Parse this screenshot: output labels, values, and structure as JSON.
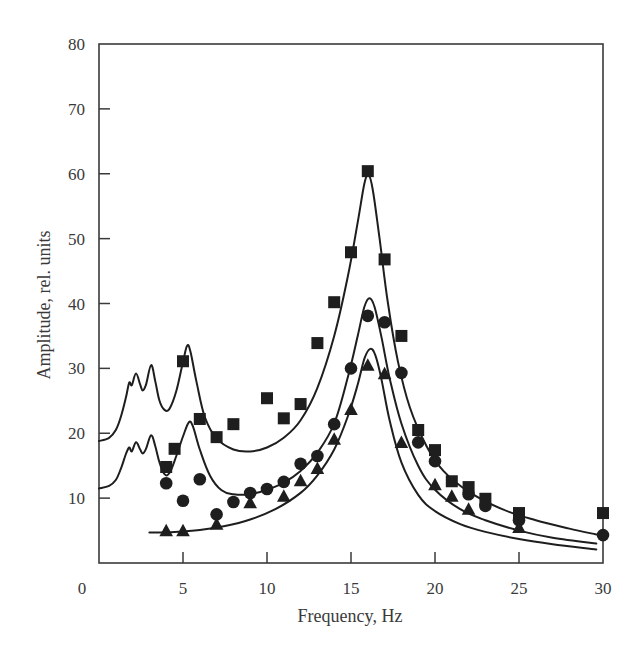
{
  "chart_data": {
    "type": "scatter",
    "title": "",
    "xlabel": "Frequency, Hz",
    "ylabel": "Amplitude, rel. units",
    "xlim": [
      0,
      30
    ],
    "ylim": [
      0,
      80
    ],
    "xticks": [
      0,
      5,
      10,
      15,
      20,
      25,
      30
    ],
    "yticks": [
      10,
      20,
      30,
      40,
      50,
      60,
      70,
      80
    ],
    "grid": false,
    "legend": null,
    "series": [
      {
        "name": "squares",
        "marker": "square",
        "points": [
          [
            4,
            14.8
          ],
          [
            4.5,
            17.6
          ],
          [
            5,
            31.1
          ],
          [
            6,
            22.2
          ],
          [
            7,
            19.4
          ],
          [
            8,
            21.4
          ],
          [
            10,
            25.4
          ],
          [
            11,
            22.3
          ],
          [
            12,
            24.5
          ],
          [
            13,
            33.9
          ],
          [
            14,
            40.2
          ],
          [
            15,
            47.9
          ],
          [
            16,
            60.4
          ],
          [
            17,
            46.8
          ],
          [
            18,
            35.0
          ],
          [
            19,
            20.5
          ],
          [
            20,
            17.4
          ],
          [
            21,
            12.6
          ],
          [
            22,
            11.7
          ],
          [
            23,
            9.9
          ],
          [
            25,
            7.7
          ],
          [
            30,
            7.7
          ]
        ]
      },
      {
        "name": "circles",
        "marker": "circle",
        "points": [
          [
            4,
            12.3
          ],
          [
            5,
            9.6
          ],
          [
            6,
            12.9
          ],
          [
            7,
            7.5
          ],
          [
            8,
            9.4
          ],
          [
            9,
            10.8
          ],
          [
            10,
            11.4
          ],
          [
            11,
            12.5
          ],
          [
            12,
            15.3
          ],
          [
            13,
            16.5
          ],
          [
            14,
            21.4
          ],
          [
            15,
            30.0
          ],
          [
            16,
            38.1
          ],
          [
            17,
            37.1
          ],
          [
            18,
            29.3
          ],
          [
            19,
            18.6
          ],
          [
            20,
            15.7
          ],
          [
            22,
            10.6
          ],
          [
            23,
            8.8
          ],
          [
            25,
            6.6
          ],
          [
            30,
            4.3
          ]
        ]
      },
      {
        "name": "triangles",
        "marker": "triangle",
        "points": [
          [
            4,
            4.9
          ],
          [
            5,
            4.9
          ],
          [
            7,
            5.9
          ],
          [
            9,
            9.2
          ],
          [
            11,
            10.2
          ],
          [
            12,
            12.6
          ],
          [
            13,
            14.5
          ],
          [
            14,
            19.0
          ],
          [
            15,
            23.6
          ],
          [
            16,
            30.4
          ],
          [
            17,
            29.1
          ],
          [
            18,
            18.5
          ],
          [
            20,
            12.0
          ],
          [
            21,
            10.2
          ],
          [
            22,
            8.2
          ],
          [
            25,
            5.4
          ]
        ]
      }
    ],
    "curves": [
      {
        "name": "upper-fit",
        "points": [
          [
            0,
            18.8
          ],
          [
            0.6,
            19.3
          ],
          [
            1.0,
            20.5
          ],
          [
            1.3,
            22.5
          ],
          [
            1.6,
            25.5
          ],
          [
            1.8,
            27.8
          ],
          [
            1.95,
            27.4
          ],
          [
            2.2,
            29.2
          ],
          [
            2.45,
            27.5
          ],
          [
            2.6,
            26.6
          ],
          [
            2.8,
            27.5
          ],
          [
            3.1,
            30.5
          ],
          [
            3.35,
            28.0
          ],
          [
            3.6,
            25.0
          ],
          [
            3.9,
            23.6
          ],
          [
            4.2,
            23.8
          ],
          [
            4.6,
            26.5
          ],
          [
            5.0,
            31.0
          ],
          [
            5.25,
            33.5
          ],
          [
            5.45,
            32.5
          ],
          [
            5.8,
            28.0
          ],
          [
            6.3,
            22.5
          ],
          [
            7.0,
            19.2
          ],
          [
            8.0,
            17.5
          ],
          [
            9.0,
            17.2
          ],
          [
            10.0,
            17.8
          ],
          [
            11.0,
            19.3
          ],
          [
            12.0,
            22.0
          ],
          [
            13.0,
            27.0
          ],
          [
            14.0,
            35.0
          ],
          [
            14.8,
            44.0
          ],
          [
            15.4,
            52.5
          ],
          [
            15.8,
            58.5
          ],
          [
            16.05,
            59.8
          ],
          [
            16.3,
            57.5
          ],
          [
            16.7,
            50.0
          ],
          [
            17.2,
            40.0
          ],
          [
            17.8,
            31.0
          ],
          [
            18.5,
            24.0
          ],
          [
            19.5,
            18.0
          ],
          [
            20.5,
            14.2
          ],
          [
            22.0,
            11.0
          ],
          [
            24.0,
            8.3
          ],
          [
            26.0,
            6.6
          ],
          [
            28.0,
            5.3
          ],
          [
            29.6,
            4.4
          ]
        ]
      },
      {
        "name": "middle-fit",
        "points": [
          [
            0,
            11.5
          ],
          [
            0.6,
            11.9
          ],
          [
            1.0,
            12.8
          ],
          [
            1.3,
            14.5
          ],
          [
            1.6,
            16.8
          ],
          [
            1.8,
            17.8
          ],
          [
            1.95,
            17.2
          ],
          [
            2.2,
            18.6
          ],
          [
            2.45,
            17.5
          ],
          [
            2.6,
            16.9
          ],
          [
            2.8,
            17.6
          ],
          [
            3.1,
            19.7
          ],
          [
            3.35,
            18.0
          ],
          [
            3.6,
            15.5
          ],
          [
            3.9,
            13.7
          ],
          [
            4.2,
            13.9
          ],
          [
            4.6,
            16.5
          ],
          [
            5.0,
            19.5
          ],
          [
            5.35,
            21.7
          ],
          [
            5.6,
            21.0
          ],
          [
            6.0,
            17.5
          ],
          [
            6.6,
            13.5
          ],
          [
            7.3,
            11.2
          ],
          [
            8.0,
            10.6
          ],
          [
            9.0,
            10.6
          ],
          [
            10.0,
            11.3
          ],
          [
            11.0,
            12.4
          ],
          [
            12.0,
            14.2
          ],
          [
            13.0,
            17.0
          ],
          [
            14.0,
            21.5
          ],
          [
            14.8,
            28.5
          ],
          [
            15.4,
            35.0
          ],
          [
            15.8,
            39.5
          ],
          [
            16.1,
            40.8
          ],
          [
            16.4,
            39.5
          ],
          [
            16.8,
            35.0
          ],
          [
            17.3,
            28.5
          ],
          [
            18.0,
            21.5
          ],
          [
            19.0,
            15.0
          ],
          [
            20.0,
            11.3
          ],
          [
            21.5,
            8.3
          ],
          [
            23.0,
            6.6
          ],
          [
            25.0,
            5.0
          ],
          [
            27.0,
            3.9
          ],
          [
            29.6,
            3.0
          ]
        ]
      },
      {
        "name": "lower-fit",
        "points": [
          [
            3.0,
            4.7
          ],
          [
            4.5,
            4.8
          ],
          [
            6.0,
            5.1
          ],
          [
            7.5,
            5.7
          ],
          [
            9.0,
            6.7
          ],
          [
            10.5,
            8.3
          ],
          [
            12.0,
            10.8
          ],
          [
            13.0,
            13.5
          ],
          [
            14.0,
            17.5
          ],
          [
            14.8,
            22.5
          ],
          [
            15.4,
            27.5
          ],
          [
            15.8,
            31.5
          ],
          [
            16.15,
            33.0
          ],
          [
            16.45,
            32.0
          ],
          [
            16.8,
            28.5
          ],
          [
            17.3,
            22.0
          ],
          [
            18.0,
            15.5
          ],
          [
            19.0,
            10.5
          ],
          [
            20.0,
            8.0
          ],
          [
            21.5,
            6.0
          ],
          [
            23.0,
            4.8
          ],
          [
            25.0,
            3.7
          ],
          [
            27.0,
            2.9
          ],
          [
            29.6,
            2.1
          ]
        ]
      }
    ]
  },
  "labels": {
    "xlabel": "Frequency, Hz",
    "ylabel": "Amplitude, rel. units",
    "x_tick_labels": [
      "0",
      "5",
      "10",
      "15",
      "20",
      "25",
      "30"
    ],
    "y_tick_labels": [
      "10",
      "20",
      "30",
      "40",
      "50",
      "60",
      "70",
      "80"
    ]
  },
  "colors": {
    "ink": "#1e1e1e",
    "axis": "#3a3a3a",
    "background": "#ffffff"
  }
}
